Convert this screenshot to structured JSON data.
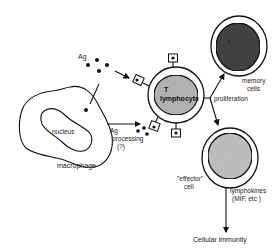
{
  "diagram": {
    "title": "",
    "labels": {
      "antigen": "Ag",
      "nucleus": "nucleus",
      "macrophage": "macrophage",
      "ag_processing_line1": "Ag",
      "ag_processing_line2": "processing",
      "ag_processing_line3": "(?)",
      "t_lymphocyte_line1": "T",
      "t_lymphocyte_line2": "lymphocyte",
      "proliferation": "proliferation",
      "memory_line1": "memory",
      "memory_line2": "cells",
      "effector_line1": "\"effector\"",
      "effector_line2": "cell",
      "lymphokines_line1": "lymphokines",
      "lymphokines_line2": "(MIF, etc )",
      "outcome": "Cellular immunity"
    },
    "nodes": [
      {
        "id": "antigen",
        "label": "Ag",
        "type": "particles"
      },
      {
        "id": "macrophage",
        "label": "macrophage",
        "type": "cell",
        "contains": [
          "nucleus"
        ]
      },
      {
        "id": "t_lymphocyte",
        "label": "T lymphocyte",
        "type": "cell"
      },
      {
        "id": "memory_cells",
        "label": "memory cells",
        "type": "cell"
      },
      {
        "id": "effector_cell",
        "label": "\"effector\" cell",
        "type": "cell"
      },
      {
        "id": "cellular_immunity",
        "label": "Cellular immunity",
        "type": "outcome"
      }
    ],
    "edges": [
      {
        "from": "antigen",
        "to": "t_lymphocyte",
        "label": ""
      },
      {
        "from": "antigen",
        "to": "macrophage",
        "label": ""
      },
      {
        "from": "macrophage",
        "to": "t_lymphocyte",
        "label": "Ag processing (?)"
      },
      {
        "from": "t_lymphocyte",
        "to": "memory_cells",
        "label": "proliferation"
      },
      {
        "from": "t_lymphocyte",
        "to": "effector_cell",
        "label": "proliferation"
      },
      {
        "from": "effector_cell",
        "to": "cellular_immunity",
        "label": "lymphokines (MIF, etc )"
      }
    ]
  }
}
